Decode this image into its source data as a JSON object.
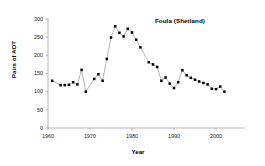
{
  "figure": {
    "background_color": "#ffffff",
    "axis_color": "#9a9a9a",
    "line_color": "#8d8d8d",
    "marker_color": "#000000",
    "text_color": "#000000"
  },
  "chart_data": {
    "type": "line",
    "title": "Foula (Shetland)",
    "xlabel": "Year",
    "ylabel": "Pairs of AOT",
    "xlim": [
      1960,
      2005
    ],
    "ylim": [
      0,
      300
    ],
    "xticks": [
      1960,
      1970,
      1980,
      1990,
      2000
    ],
    "xtick_labels": [
      "1960",
      "1970",
      "1980",
      "1990",
      "2000"
    ],
    "yticks": [
      0,
      50,
      100,
      150,
      200,
      250,
      300
    ],
    "ytick_labels": [
      "0",
      "50",
      "100",
      "150",
      "200",
      "250",
      "300"
    ],
    "grid": false,
    "legend": false,
    "marker": "square",
    "series": [
      {
        "name": "Foula (Shetland) AOT pairs",
        "x": [
          1961,
          1963,
          1964,
          1965,
          1966,
          1967,
          1968,
          1969,
          1971,
          1972,
          1973,
          1974,
          1975,
          1976,
          1977,
          1978,
          1979,
          1980,
          1981,
          1982,
          1984,
          1985,
          1986,
          1987,
          1988,
          1989,
          1990,
          1991,
          1992,
          1993,
          1994,
          1995,
          1996,
          1997,
          1998,
          1999,
          2000,
          2001,
          2002
        ],
        "values": [
          130,
          118,
          118,
          119,
          126,
          120,
          160,
          100,
          135,
          148,
          130,
          190,
          249,
          280,
          262,
          252,
          273,
          263,
          243,
          222,
          181,
          175,
          168,
          130,
          139,
          122,
          110,
          126,
          159,
          145,
          138,
          133,
          128,
          124,
          120,
          108,
          107,
          114,
          100
        ]
      }
    ]
  }
}
